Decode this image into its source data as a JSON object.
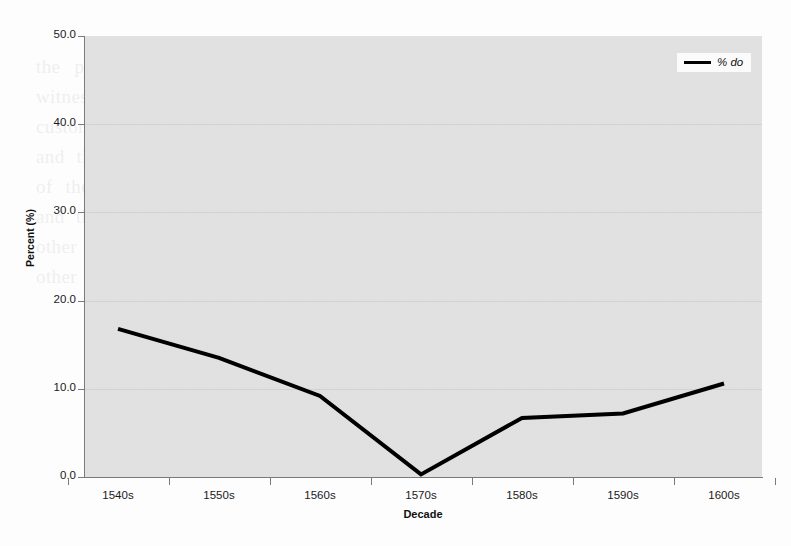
{
  "chart_data": {
    "type": "line",
    "title": "",
    "xlabel": "Decade",
    "ylabel": "Percent (%)",
    "categories": [
      "1540s",
      "1550s",
      "1560s",
      "1570s",
      "1580s",
      "1590s",
      "1600s"
    ],
    "series": [
      {
        "name": "% do",
        "values": [
          16.8,
          13.5,
          9.2,
          0.3,
          6.7,
          7.2,
          10.6
        ],
        "color": "#000000",
        "line_width": 4
      }
    ],
    "ylim": [
      0.0,
      50.0
    ],
    "ytick_step": 10.0,
    "ytick_labels": [
      "0.0",
      "10.0",
      "20.0",
      "30.0",
      "40.0",
      "50.0"
    ],
    "grid": "horizontal",
    "grid_color": "#d2d2d2",
    "plot_background": "#e3e3e3",
    "page_background": "#fdfdfd",
    "legend": {
      "position": "top-right",
      "entries": [
        {
          "label": "% do",
          "color": "#000000",
          "style": "italic"
        }
      ]
    }
  },
  "ghost_text": "the plain black gown appeared in the reign of the other which a number of witnesses upon the scene and inquiry at the several tones and the course and custom of the other of the same for the and the others had been also more and and the made also they the persons and some and the other and they the other of the state of the other and the same and the tale of the other in the other and the other person and the other to the other and they said the other and the other person to the others and the other and the other while the other also the other more"
}
